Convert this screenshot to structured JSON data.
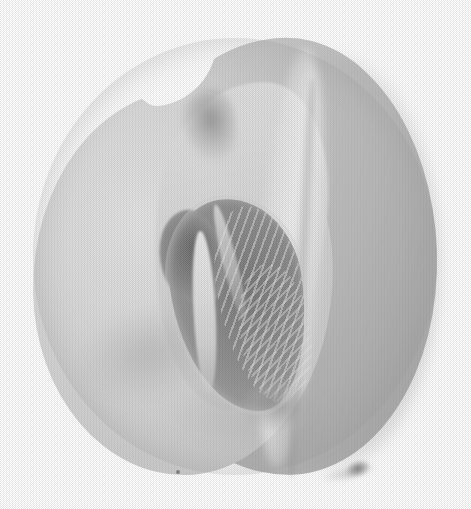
{
  "image": {
    "subject": "melon-half-cut-open",
    "description": "Halftone black-and-white photograph of a melon cut in half, showing the pale flesh face and the dark seed cavity in the centre",
    "medium": "halftone print reproduction",
    "canvas": {
      "width": 471,
      "height": 509
    },
    "background_color": "#ffffff"
  },
  "subject": {
    "name": "melon",
    "state": "cut-open-half",
    "silhouette": {
      "left": 33,
      "top": 38,
      "width": 404,
      "height": 437,
      "shape": "rounded-oval"
    },
    "parts": [
      {
        "id": "back-rind",
        "label": "Back rind half",
        "tone": "#bdbdbd"
      },
      {
        "id": "flesh-face",
        "label": "Cut flesh surface",
        "tone": "#d6d6d6"
      },
      {
        "id": "rim-highlight",
        "label": "Rim highlight band",
        "tone": "#f5f5f5"
      },
      {
        "id": "seed-cavity",
        "label": "Seed cavity",
        "tone": "#7d7d7d"
      },
      {
        "id": "fibre-strands",
        "label": "Pale fibrous strands",
        "tone": "#ebebeb"
      },
      {
        "id": "top-notch",
        "label": "Notch shadow at top",
        "tone": "#6e6e6e"
      },
      {
        "id": "stem-scar",
        "label": "Stem scar blemish",
        "tone": "#5c5c5c"
      }
    ]
  },
  "palette": {
    "paper_white": "#ffffff",
    "flesh_light": "#e4e4e4",
    "flesh_mid": "#d2d2d2",
    "rind_mid": "#bdbdbd",
    "rind_dark": "#adadad",
    "cavity_dark": "#6f6f6f",
    "cavity_deep": "#555555",
    "fibre_white": "#f0f0f0",
    "shadow_grey": "#969696"
  },
  "texture": {
    "type": "halftone-dot-screen",
    "cell_size_px": 2,
    "pattern": "checkerboard"
  }
}
